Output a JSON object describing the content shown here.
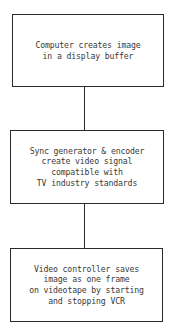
{
  "diagram": {
    "type": "flowchart",
    "direction": "top-to-bottom",
    "nodes": [
      {
        "id": "step1",
        "text": "Computer creates image\nin a display buffer"
      },
      {
        "id": "step2",
        "text": "Sync generator & encoder\ncreate video signal\ncompatible with\nTV industry standards"
      },
      {
        "id": "step3",
        "text": "Video controller saves\nimage as one frame\non videotape by starting\nand stopping VCR"
      }
    ],
    "edges": [
      {
        "from": "step1",
        "to": "step2"
      },
      {
        "from": "step2",
        "to": "step3"
      }
    ]
  }
}
